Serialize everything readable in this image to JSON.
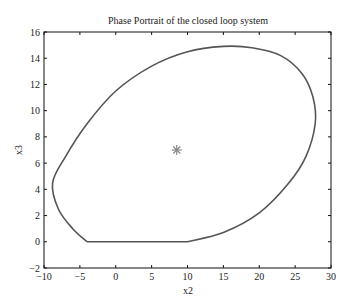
{
  "chart_data": {
    "type": "line",
    "title": "Phase Portrait of the closed loop system",
    "xlabel": "x2",
    "ylabel": "x3",
    "xlim": [
      -10,
      30
    ],
    "ylim": [
      -2,
      16
    ],
    "xticks": [
      "-10",
      "-5",
      "0",
      "5",
      "10",
      "15",
      "20",
      "25",
      "30"
    ],
    "yticks": [
      "-2",
      "0",
      "2",
      "4",
      "6",
      "8",
      "10",
      "12",
      "14",
      "16"
    ],
    "grid": false,
    "legend": null,
    "series": [
      {
        "name": "trajectory",
        "type": "line",
        "color": "#555555",
        "x": [
          -4,
          10,
          15,
          20,
          24,
          26.5,
          27.8,
          27.5,
          26,
          23,
          19,
          15,
          10,
          5,
          0,
          -4,
          -7,
          -8.8,
          -8,
          -6,
          -4
        ],
        "y": [
          0,
          0,
          0.7,
          2.2,
          4.4,
          6.5,
          9,
          11,
          12.8,
          14.2,
          14.8,
          14.9,
          14.5,
          13.4,
          11.5,
          9,
          6.5,
          4.5,
          2.5,
          1,
          0
        ]
      },
      {
        "name": "equilibrium",
        "type": "scatter",
        "marker": "*",
        "color": "#888888",
        "x": [
          8.5
        ],
        "y": [
          7
        ]
      }
    ]
  }
}
